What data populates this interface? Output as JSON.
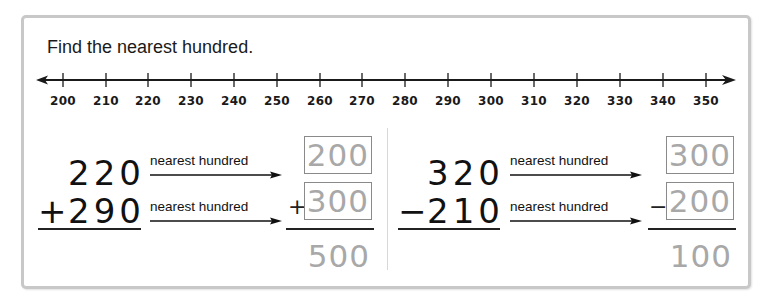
{
  "instruction": "Find the nearest hundred.",
  "number_line": {
    "ticks": [
      "200",
      "210",
      "220",
      "230",
      "240",
      "250",
      "260",
      "270",
      "280",
      "290",
      "300",
      "310",
      "320",
      "330",
      "340",
      "350"
    ],
    "emphasized": [
      "200",
      "300"
    ]
  },
  "problems": [
    {
      "operation": "addition",
      "top": "220",
      "bottom": "290",
      "operator": "+",
      "arrow_label_top": "nearest hundred",
      "arrow_label_bottom": "nearest hundred",
      "rounded_top": "200",
      "rounded_bottom": "300",
      "rounded_operator": "+",
      "result": "500"
    },
    {
      "operation": "subtraction",
      "top": "320",
      "bottom": "210",
      "operator": "−",
      "arrow_label_top": "nearest hundred",
      "arrow_label_bottom": "nearest hundred",
      "rounded_top": "300",
      "rounded_bottom": "200",
      "rounded_operator": "−",
      "result": "100"
    }
  ]
}
